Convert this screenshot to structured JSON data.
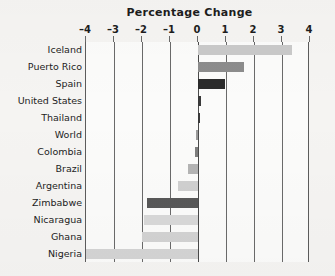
{
  "chart_data": {
    "type": "bar",
    "orientation": "horizontal",
    "title": "Percentage Change",
    "xlabel": "",
    "ylabel": "",
    "xlim": [
      -4,
      4
    ],
    "xticks": [
      -4,
      -3,
      -2,
      -1,
      0,
      1,
      2,
      3,
      4
    ],
    "xtick_labels": [
      "–4",
      "–3",
      "–2",
      "–1",
      "0",
      "1",
      "2",
      "3",
      "4"
    ],
    "grid": true,
    "legend": null,
    "categories": [
      "Iceland",
      "Puerto Rico",
      "Spain",
      "United States",
      "Thailand",
      "World",
      "Colombia",
      "Brazil",
      "Argentina",
      "Zimbabwe",
      "Nicaragua",
      "Ghana",
      "Nigeria"
    ],
    "values": [
      3.35,
      1.65,
      0.98,
      0.1,
      0.08,
      -0.08,
      -0.12,
      -0.35,
      -0.7,
      -1.82,
      -1.92,
      -2.0,
      -4.0
    ],
    "bar_colors": [
      "#c9c9c9",
      "#8c8c8c",
      "#2b2b2b",
      "#3a3a3a",
      "#3a3a3a",
      "#9a9a9a",
      "#7e7e7e",
      "#b4b4b4",
      "#cfcfcf",
      "#585858",
      "#d8d8d8",
      "#d2d2d2",
      "#d4d4d4"
    ]
  },
  "colors": {
    "page_background": "#f5f4f2",
    "plot_background": "#fbfbfa",
    "axis": "#5c5c5c",
    "gridline": "#6a6a6a",
    "text": "#1d1d1d"
  }
}
